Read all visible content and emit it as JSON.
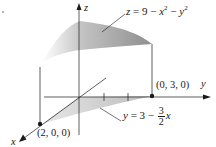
{
  "figure": {
    "axes": {
      "x_label": "x",
      "y_label": "y",
      "z_label": "z"
    },
    "points": [
      {
        "label": "(2, 0, 0)"
      },
      {
        "label": "(0, 3, 0)"
      }
    ],
    "surface_equation": {
      "lhs": "z",
      "eq": "=",
      "rhs_prefix": "9 − ",
      "x": "x",
      "minus": " − ",
      "y": "y",
      "exp": "2"
    },
    "line_equation": {
      "lhs": "y",
      "eq": " = 3 − ",
      "num": "3",
      "den": "2",
      "var": "x"
    },
    "colors": {
      "ink": "#1a1a1a",
      "surface_shade": "#9a9a9a",
      "surface_light": "#d8d8d8",
      "region_shade": "#c8c8c8"
    }
  }
}
